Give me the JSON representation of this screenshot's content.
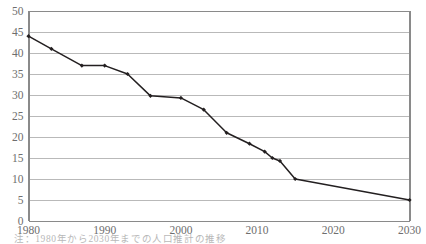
{
  "chart_data": {
    "type": "line",
    "title": "",
    "subtitle": "",
    "xlabel": "",
    "ylabel": "",
    "x": [
      1980,
      1983,
      1987,
      1990,
      1993,
      1996,
      2000,
      2003,
      2006,
      2009,
      2011,
      2012,
      2013,
      2015,
      2030
    ],
    "values": [
      44,
      41,
      37,
      37,
      35,
      29.8,
      29.3,
      26.5,
      21,
      18.4,
      16.5,
      15,
      14.3,
      10,
      5
    ],
    "xlim": [
      1980,
      2030
    ],
    "ylim": [
      0,
      50
    ],
    "ytick_labels": [
      "0",
      "5",
      "10",
      "15",
      "20",
      "25",
      "30",
      "35",
      "40",
      "45",
      "50"
    ],
    "ytick_values": [
      0,
      5,
      10,
      15,
      20,
      25,
      30,
      35,
      40,
      45,
      50
    ],
    "xtick_labels": [
      "1980",
      "1990",
      "2000",
      "2010",
      "2020",
      "2030"
    ],
    "xtick_values": [
      1980,
      1990,
      2000,
      2010,
      2020,
      2030
    ],
    "grid": true,
    "grid_axis": "y",
    "legend": false,
    "legend_position": "none",
    "series": [
      {
        "name": "",
        "values": [
          44,
          41,
          37,
          37,
          35,
          29.8,
          29.3,
          26.5,
          21,
          18.4,
          16.5,
          15,
          14.3,
          10,
          5
        ],
        "color": "#231f20",
        "marker": "diamond"
      }
    ],
    "annotations": []
  },
  "colors": {
    "line": "#231f20",
    "marker": "#231f20",
    "grid": "#b9b9b9",
    "axis": "#8a8a8a",
    "tick_text": "#6e6e6e",
    "background": "#ffffff",
    "caption_text": "#7d7d7d"
  },
  "caption": {
    "text": "注：1980年から2030年までの人口推計の推移"
  }
}
